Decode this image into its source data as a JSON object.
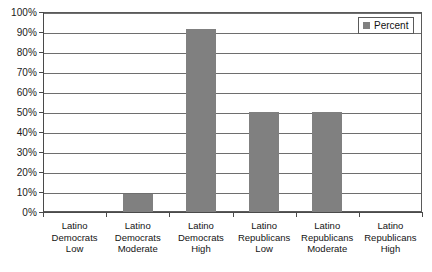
{
  "chart_data": {
    "type": "bar",
    "title": "",
    "subtitle": "",
    "xlabel": "",
    "ylabel": "",
    "categories": [
      "Latino Democrats Low",
      "Latino Democrats Moderate",
      "Latino Democrats High",
      "Latino Republicans Low",
      "Latino Republicans Moderate",
      "Latino Republicans High"
    ],
    "category_lines": [
      [
        "Latino",
        "Democrats",
        "Low"
      ],
      [
        "Latino",
        "Democrats",
        "Moderate"
      ],
      [
        "Latino",
        "Democrats",
        "High"
      ],
      [
        "Latino",
        "Republicans",
        "Low"
      ],
      [
        "Latino",
        "Republicans",
        "Moderate"
      ],
      [
        "Latino",
        "Republicans",
        "High"
      ]
    ],
    "series": [
      {
        "name": "Percent",
        "color": "#808080",
        "values": [
          0,
          9,
          91.5,
          50,
          50,
          0
        ]
      }
    ],
    "values": [
      0,
      9,
      91.5,
      50,
      50,
      0
    ],
    "ylim": [
      0,
      100
    ],
    "ytick_labels": [
      "0%",
      "10%",
      "20%",
      "30%",
      "40%",
      "50%",
      "60%",
      "70%",
      "80%",
      "90%",
      "100%"
    ],
    "ytick_values": [
      0,
      10,
      20,
      30,
      40,
      50,
      60,
      70,
      80,
      90,
      100
    ],
    "grid": true,
    "legend": {
      "position": "top-right",
      "entries": [
        {
          "label": "Percent",
          "color": "#808080"
        }
      ]
    }
  }
}
